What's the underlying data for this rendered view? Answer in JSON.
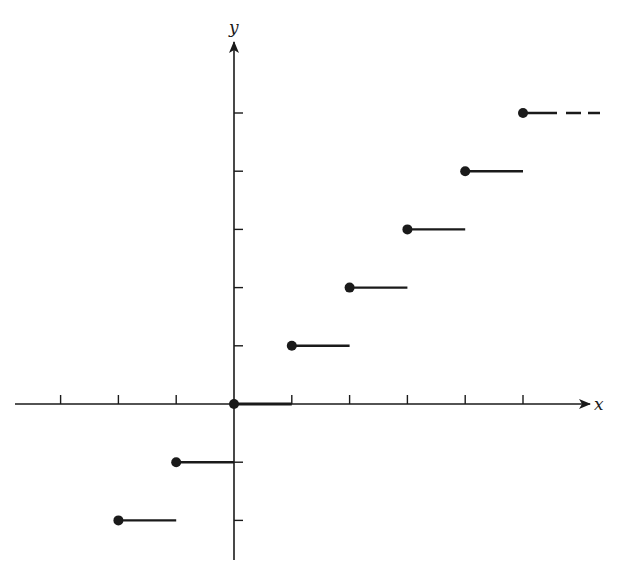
{
  "chart_data": {
    "type": "line",
    "title": "",
    "subtitle": "",
    "function": "floor",
    "xlabel": "x",
    "ylabel": "y",
    "x_ticks": [
      -3,
      -2,
      -1,
      1,
      2,
      3,
      4,
      5
    ],
    "y_ticks": [
      -2,
      -1,
      1,
      2,
      3,
      4,
      5
    ],
    "tick_labels_shown": false,
    "grid": false,
    "legend": null,
    "xlim": [
      -3.8,
      6.2
    ],
    "ylim": [
      -2.7,
      6.2
    ],
    "steps": [
      {
        "x_start": -2,
        "x_end": -1,
        "y": -2,
        "closed_left": true
      },
      {
        "x_start": -1,
        "x_end": 0,
        "y": -1,
        "closed_left": true
      },
      {
        "x_start": 0,
        "x_end": 1,
        "y": 0,
        "closed_left": true
      },
      {
        "x_start": 1,
        "x_end": 2,
        "y": 1,
        "closed_left": true
      },
      {
        "x_start": 2,
        "x_end": 3,
        "y": 2,
        "closed_left": true
      },
      {
        "x_start": 3,
        "x_end": 4,
        "y": 3,
        "closed_left": true
      },
      {
        "x_start": 4,
        "x_end": 5,
        "y": 4,
        "closed_left": true
      },
      {
        "x_start": 5,
        "x_end": 5.6,
        "y": 5,
        "closed_left": true,
        "continues": true
      }
    ],
    "colors": {
      "ink": "#1a1a1a",
      "background": "#ffffff"
    }
  },
  "labels": {
    "x_axis": "x",
    "y_axis": "y"
  }
}
